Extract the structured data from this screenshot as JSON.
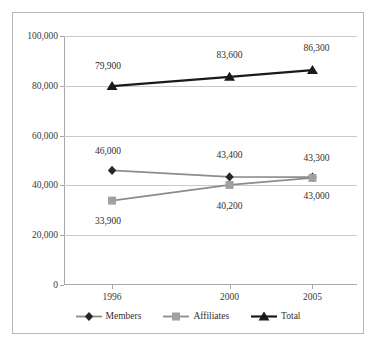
{
  "chart_data": {
    "type": "line",
    "title": "",
    "subtitle": "",
    "xlabel": "",
    "ylabel": "",
    "categories": [
      "1996",
      "2000",
      "2005"
    ],
    "ylim": [
      0,
      100000
    ],
    "yticks": [
      "0",
      "20,000",
      "40,000",
      "60,000",
      "80,000",
      "100,000"
    ],
    "ytick_values": [
      0,
      20000,
      40000,
      60000,
      80000,
      100000
    ],
    "grid": true,
    "legend_position": "bottom",
    "series": [
      {
        "name": "Members",
        "marker": "diamond",
        "color": "#262626",
        "line_color": "#8c8c8c",
        "values": [
          46000,
          43400,
          43300
        ],
        "labels": [
          "46,000",
          "43,400",
          "43,300"
        ]
      },
      {
        "name": "Affiliates",
        "marker": "square",
        "color": "#a0a0a0",
        "line_color": "#8c8c8c",
        "values": [
          33900,
          40200,
          43000
        ],
        "labels": [
          "33,900",
          "40,200",
          "43,000"
        ]
      },
      {
        "name": "Total",
        "marker": "triangle",
        "color": "#1a1a1a",
        "line_color": "#1a1a1a",
        "values": [
          79900,
          83600,
          86300
        ],
        "labels": [
          "79,900",
          "83,600",
          "86,300"
        ]
      }
    ]
  },
  "colors": {
    "frame": "#b8b8b8",
    "gridline": "#c9c9c9",
    "axis": "#a8a8a8",
    "text": "#2f2f2f",
    "background": "#ffffff"
  }
}
